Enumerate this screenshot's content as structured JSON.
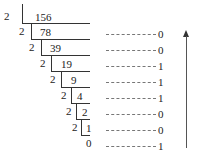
{
  "diagram": {
    "divisor": "2",
    "quotients": [
      "156",
      "78",
      "39",
      "19",
      "9",
      "4",
      "2",
      "1",
      "0"
    ],
    "remainders": [
      "0",
      "0",
      "1",
      "1",
      "1",
      "0",
      "0",
      "1"
    ],
    "dash_text": "----------",
    "arrow_direction": "up",
    "colors": {
      "text": "#222222",
      "lines": "#333333",
      "dashes": "#777777"
    }
  }
}
